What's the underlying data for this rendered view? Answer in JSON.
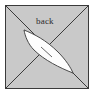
{
  "figure": {
    "title": "back",
    "type": "geometric-diagram",
    "canvas": {
      "width": 96,
      "height": 99
    },
    "background_color": "#ffffff",
    "square": {
      "name": "outer-square",
      "x": 5,
      "y": 5,
      "width": 84,
      "height": 84,
      "fill_color": "#c9c9c9",
      "stroke_color": "#3a3a3a",
      "stroke_width": 1
    },
    "diagonals": [
      {
        "name": "diagonal-nw-se",
        "from": [
          5,
          5
        ],
        "to": [
          89,
          89
        ],
        "stroke_color": "#3a3a3a",
        "stroke_width": 1
      },
      {
        "name": "diagonal-ne-sw",
        "from": [
          89,
          5
        ],
        "to": [
          5,
          89
        ],
        "stroke_color": "#3a3a3a",
        "stroke_width": 1
      }
    ],
    "lens": {
      "name": "lens-shape",
      "description": "elongated white leaf/lens along the NW-SE diagonal",
      "tip_start": [
        24,
        30
      ],
      "tip_end": [
        73,
        73
      ],
      "fill_color": "#fdfdfd",
      "stroke_color": "#4a4a4a",
      "stroke_width": 1
    },
    "crease": {
      "name": "crease-line",
      "from": [
        41,
        47
      ],
      "to": [
        52,
        57
      ],
      "stroke_color": "#6a6a6a",
      "stroke_width": 1
    },
    "labels": [
      {
        "name": "back",
        "text": "back",
        "x": 36,
        "y": 17,
        "color": "#2b2b2b",
        "font_size": 9
      }
    ]
  }
}
